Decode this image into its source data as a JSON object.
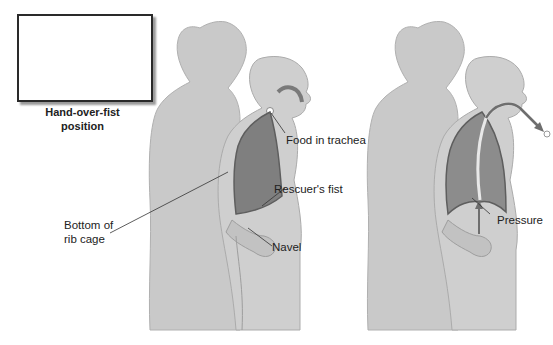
{
  "inset": {
    "caption_line1": "Hand-over-fist",
    "caption_line2": "position"
  },
  "scene_left": {
    "labels": {
      "food": "Food in trachea",
      "fist": "Rescuer's fist",
      "ribcage_line1": "Bottom of",
      "ribcage_line2": "rib cage",
      "navel": "Navel"
    }
  },
  "scene_right": {
    "labels": {
      "pressure": "Pressure"
    }
  },
  "colors": {
    "figure": "#c9c9c9",
    "figure_outline": "#a8a8a8",
    "lung_dark": "#7f7f7f",
    "lung_light": "#a2a2a2",
    "arrow": "#6e6e6e"
  }
}
